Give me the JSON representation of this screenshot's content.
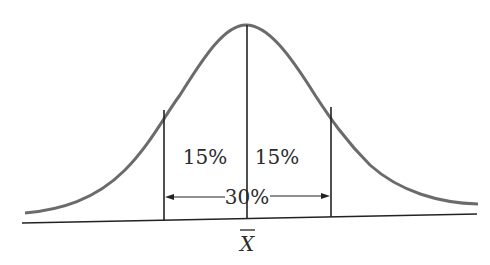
{
  "diagram": {
    "type": "normal-distribution",
    "labels": {
      "left_area": "15%",
      "right_area": "15%",
      "span": "30%",
      "mean": "X"
    },
    "mean_symbol_has_bar": true,
    "colors": {
      "curve": "#6b6b6b",
      "lines": "#222222",
      "text": "#2a2a2a",
      "background": "#ffffff"
    }
  }
}
